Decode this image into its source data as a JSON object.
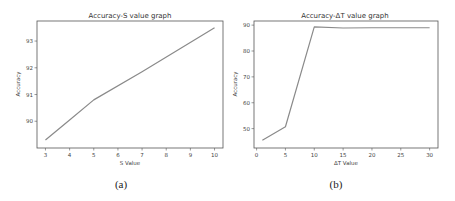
{
  "chart_data": [
    {
      "type": "line",
      "title": "Accuracy-S value graph",
      "xlabel": "S Value",
      "ylabel": "Accuracy",
      "caption": "(a)",
      "x": [
        3,
        4,
        5,
        7,
        10
      ],
      "values": [
        89.3,
        90.05,
        90.8,
        91.85,
        93.5
      ],
      "xticks": [
        3,
        4,
        5,
        6,
        7,
        8,
        9,
        10
      ],
      "yticks": [
        90,
        91,
        92,
        93
      ],
      "xlim": [
        2.65,
        10.35
      ],
      "ylim": [
        89.0,
        93.75
      ],
      "grid": false,
      "legend": null,
      "series_color": "#8a8a8a"
    },
    {
      "type": "line",
      "title": "Accuracy-ΔT value graph",
      "xlabel": "ΔT Value",
      "ylabel": "Accuracy",
      "caption": "(b)",
      "x": [
        1,
        5,
        10,
        15,
        20,
        25,
        30
      ],
      "values": [
        45.5,
        50.7,
        89.3,
        88.9,
        89.0,
        89.0,
        89.0
      ],
      "xticks": [
        0,
        5,
        10,
        15,
        20,
        25,
        30
      ],
      "yticks": [
        50,
        60,
        70,
        80,
        90
      ],
      "xlim": [
        -0.45,
        31.45
      ],
      "ylim": [
        42.5,
        91.6
      ],
      "grid": false,
      "legend": null,
      "series_color": "#8a8a8a"
    }
  ]
}
